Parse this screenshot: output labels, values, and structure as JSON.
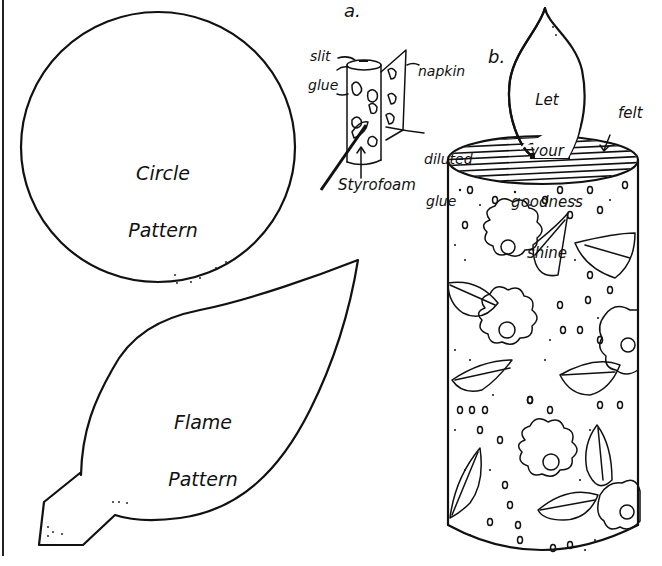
{
  "page": {
    "background": "#ffffff",
    "ink_color": "#111111"
  },
  "circle_pattern": {
    "label_line1": "Circle",
    "label_line2": "Pattern"
  },
  "flame_pattern": {
    "label_line1": "Flame",
    "label_line2": "Pattern"
  },
  "figure_a": {
    "marker": "a.",
    "labels": {
      "slit": "slit",
      "glue": "glue",
      "napkin": "napkin",
      "diluted_line1": "diluted",
      "diluted_line2": "glue",
      "styrofoam": "Styrofoam"
    }
  },
  "figure_b": {
    "marker": "b.",
    "flame_text": [
      "Let",
      "your",
      "goodness",
      "shine"
    ],
    "felt_label": "felt"
  }
}
